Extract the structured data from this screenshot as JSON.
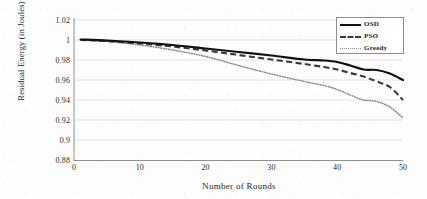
{
  "chart_data": {
    "type": "line",
    "title": "",
    "xlabel": "Number of Rounds",
    "ylabel": "Residual Energy (in Joules)",
    "xlim": [
      0,
      50
    ],
    "ylim": [
      0.88,
      1.02
    ],
    "xticks": [
      "0",
      "10",
      "20",
      "30",
      "40",
      "50"
    ],
    "yticks": [
      "0.88",
      "0.9",
      "0.92",
      "0.94",
      "0.96",
      "0.98",
      "1",
      "1.02"
    ],
    "grid": "horizontal",
    "legend_position": "top-right",
    "x": [
      1,
      5,
      10,
      15,
      20,
      25,
      30,
      35,
      38,
      40,
      42,
      44,
      46,
      48,
      50
    ],
    "series": [
      {
        "name": "OSD",
        "style": "solid",
        "color": "#111111",
        "values": [
          1.0005,
          0.9995,
          0.9975,
          0.995,
          0.9915,
          0.988,
          0.9845,
          0.9805,
          0.9795,
          0.978,
          0.9745,
          0.9705,
          0.97,
          0.9665,
          0.96
        ]
      },
      {
        "name": "PSO",
        "style": "dashed",
        "color": "#3a3a3a",
        "values": [
          1.0,
          0.999,
          0.9965,
          0.9935,
          0.9895,
          0.985,
          0.9805,
          0.976,
          0.973,
          0.9705,
          0.967,
          0.9635,
          0.9585,
          0.953,
          0.94
        ]
      },
      {
        "name": "Greedy",
        "style": "dotted",
        "color": "#8a8a8a",
        "values": [
          1.0,
          0.9985,
          0.995,
          0.99,
          0.9835,
          0.9745,
          0.966,
          0.9585,
          0.9545,
          0.9505,
          0.945,
          0.94,
          0.9385,
          0.933,
          0.922
        ]
      }
    ]
  },
  "legend": {
    "items": [
      {
        "label": "OSD"
      },
      {
        "label": "PSO"
      },
      {
        "label": "Greedy"
      }
    ]
  }
}
